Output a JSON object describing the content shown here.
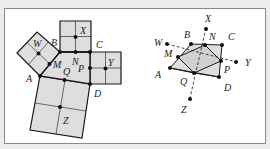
{
  "figure": {
    "left": {
      "squares": [
        "W",
        "X",
        "Y",
        "Z"
      ],
      "points": [
        "A",
        "B",
        "C",
        "D",
        "M",
        "N",
        "P",
        "Q"
      ],
      "labels": {
        "W": "W",
        "X": "X",
        "Y": "Y",
        "Z": "Z",
        "A": "A",
        "B": "B",
        "C": "C",
        "D": "D",
        "M": "M",
        "N": "N",
        "P": "P",
        "Q": "Q"
      }
    },
    "right": {
      "labels": {
        "W": "W",
        "X": "X",
        "Y": "Y",
        "Z": "Z",
        "A": "A",
        "B": "B",
        "C": "C",
        "D": "D",
        "M": "M",
        "N": "N",
        "P": "P",
        "Q": "Q"
      }
    },
    "colors": {
      "fill": "#dedede",
      "stroke": "#1a1a1a",
      "frame": "#8a8a8a"
    }
  }
}
